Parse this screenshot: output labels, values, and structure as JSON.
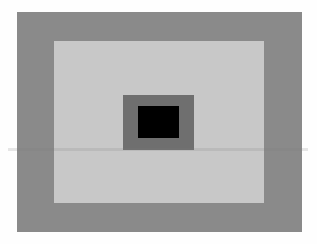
{
  "figure": {
    "colors": {
      "background": "#fefefe",
      "outer": "#8a8a8a",
      "middle": "#c8c8c8",
      "inner": "#6f6f6f",
      "core": "#000000"
    },
    "rects": [
      {
        "name": "outer-rect",
        "x": 17,
        "y": 12,
        "w": 285,
        "h": 220
      },
      {
        "name": "middle-rect",
        "x": 54,
        "y": 41,
        "w": 210,
        "h": 162
      },
      {
        "name": "inner-rect",
        "x": 123,
        "y": 95,
        "w": 71,
        "h": 55
      },
      {
        "name": "core-rect",
        "x": 138,
        "y": 106,
        "w": 41,
        "h": 32
      }
    ]
  }
}
